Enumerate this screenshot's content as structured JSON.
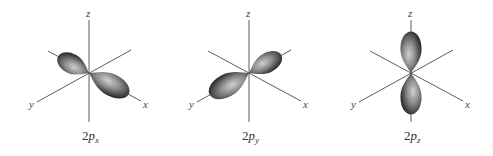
{
  "figure": {
    "background": "#ffffff",
    "lobe_colors": {
      "rim": "#2e2e2e",
      "mid": "#6a6a6a",
      "highlight": "#c8c8c8"
    },
    "panels": [
      {
        "id": "2px",
        "caption": {
          "prefix": "2",
          "letter": "p",
          "subscript": "x"
        },
        "axes": {
          "z": "z",
          "y": "y",
          "x": "x"
        },
        "lobe_orientation": "along x axis (upper-left to lower-right)"
      },
      {
        "id": "2py",
        "caption": {
          "prefix": "2",
          "letter": "p",
          "subscript": "y"
        },
        "axes": {
          "z": "z",
          "y": "y",
          "x": "x"
        },
        "lobe_orientation": "along y axis (lower-left to upper-right)"
      },
      {
        "id": "2pz",
        "caption": {
          "prefix": "2",
          "letter": "p",
          "subscript": "z"
        },
        "axes": {
          "z": "z",
          "y": "y",
          "x": "x"
        },
        "lobe_orientation": "along z axis (vertical)"
      }
    ]
  }
}
